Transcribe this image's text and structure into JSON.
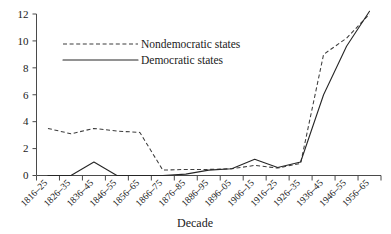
{
  "chart_data": {
    "type": "line",
    "title": "",
    "xlabel": "Decade",
    "ylabel": "",
    "ylim": [
      0,
      12
    ],
    "yticks": [
      0,
      2,
      4,
      6,
      8,
      10,
      12
    ],
    "grid": false,
    "legend_position": "upper-left-inside",
    "categories": [
      "1816–25",
      "1826–35",
      "1836–45",
      "1846–55",
      "1856–65",
      "1866–75",
      "1876–85",
      "1886–95",
      "1896–05",
      "1906–15",
      "1916–25",
      "1926–35",
      "1936–45",
      "1946–55",
      "1956–65"
    ],
    "series": [
      {
        "name": "Nondemocratic states",
        "style": "dashed",
        "color": "#3d3d3d",
        "values": [
          3.5,
          3.1,
          3.5,
          3.3,
          3.2,
          0.4,
          0.45,
          0.45,
          0.5,
          0.75,
          0.55,
          0.9,
          9.0,
          10.2,
          12.0
        ]
      },
      {
        "name": "Democratic states",
        "style": "solid",
        "color": "#262626",
        "values": [
          0.0,
          0.0,
          1.0,
          0.0,
          0.0,
          0.0,
          0.1,
          0.4,
          0.5,
          1.2,
          0.6,
          1.0,
          6.0,
          9.6,
          12.2
        ]
      }
    ]
  },
  "legend": {
    "entries": [
      {
        "label": "Nondemocratic states",
        "style": "dashed"
      },
      {
        "label": "Democratic states",
        "style": "solid"
      }
    ]
  },
  "axis": {
    "x_title": "Decade"
  }
}
